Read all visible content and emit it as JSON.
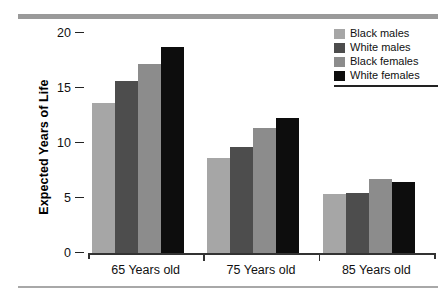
{
  "chart_data": {
    "type": "bar",
    "title": "",
    "subtitle": "",
    "xlabel": "",
    "ylabel": "Expected Years of Life",
    "categories": [
      "65 Years old",
      "75 Years old",
      "85 Years old"
    ],
    "series": [
      {
        "name": "Black males",
        "color": "#a6a6a6",
        "values": [
          13.6,
          8.6,
          5.4
        ]
      },
      {
        "name": "White males",
        "color": "#4d4d4d",
        "values": [
          15.6,
          9.6,
          5.5
        ]
      },
      {
        "name": "Black females",
        "color": "#8c8c8c",
        "values": [
          17.2,
          11.4,
          6.7
        ]
      },
      {
        "name": "White females",
        "color": "#0d0d0d",
        "values": [
          18.7,
          12.3,
          6.5
        ]
      }
    ],
    "ylim": [
      0,
      20
    ],
    "yticks": [
      "20",
      "15",
      "10",
      "5",
      "0"
    ],
    "ytick_values": [
      20,
      15,
      10,
      5,
      0
    ],
    "grid": false,
    "legend_position": "top-right"
  },
  "legend": {
    "entries": [
      {
        "label": "Black males"
      },
      {
        "label": "White males"
      },
      {
        "label": "Black females"
      },
      {
        "label": "White females"
      }
    ]
  },
  "colors": {
    "top_rule": "#9a9a9a",
    "bottom_rule": "#a8a8a8",
    "axis": "#333333",
    "text": "#111111",
    "background": "#ffffff"
  }
}
